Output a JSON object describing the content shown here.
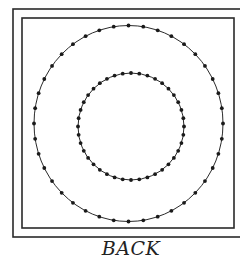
{
  "figure": {
    "caption": "BACK",
    "stroke_color": "#2a2a2a",
    "dot_color": "#1a1a1a",
    "outer_frame": {
      "x": 13,
      "y": 9,
      "w": 232,
      "h": 228
    },
    "inner_frame": {
      "x": 22,
      "y": 18,
      "w": 212,
      "h": 210
    },
    "rings": [
      {
        "name": "outer-ring",
        "cx": 128.5,
        "cy": 123.5,
        "rx": 94.5,
        "ry": 98,
        "dots": 40
      },
      {
        "name": "inner-ring",
        "cx": 131,
        "cy": 126.5,
        "rx": 53,
        "ry": 53.5,
        "dots": 40
      }
    ]
  }
}
